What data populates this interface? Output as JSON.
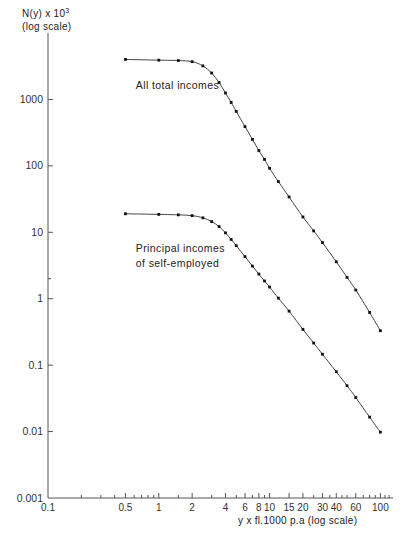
{
  "chart_data": {
    "type": "line",
    "title": "",
    "xlabel": "y x fl.1000 p.a  (log scale)",
    "ylabel_line1": "N(y) x 10",
    "ylabel_exp": "3",
    "ylabel_line2": "(log scale)",
    "xscale": "log",
    "yscale": "log",
    "xlim": [
      0.1,
      130
    ],
    "ylim": [
      0.001,
      10000
    ],
    "grid": false,
    "legend": "inline-annotations",
    "xticks": [
      0.1,
      0.5,
      1,
      2,
      4,
      6,
      8,
      10,
      15,
      20,
      30,
      40,
      60,
      100
    ],
    "xticklabels": [
      "0.1",
      "0.5",
      "1",
      "2",
      "4",
      "6",
      "8",
      "10",
      "15",
      "20",
      "30",
      "40",
      "60",
      "100"
    ],
    "xminorticks": [
      0.2,
      0.3,
      0.4,
      0.6,
      0.7,
      0.8,
      0.9,
      1.5,
      3,
      5,
      7,
      9,
      25,
      35,
      45,
      50,
      70,
      80,
      90,
      110,
      120
    ],
    "yticks": [
      0.001,
      0.01,
      0.1,
      1,
      10,
      100,
      1000
    ],
    "yticklabels": [
      "0.001",
      "0.01",
      "0.1",
      "1",
      "10",
      "100",
      "1000"
    ],
    "yminorticks": [
      2
    ],
    "series": [
      {
        "name": "All total incomes",
        "annotation": "All total incomes",
        "annotation_x": 0.62,
        "annotation_y": 1450,
        "x": [
          0.5,
          1.0,
          1.5,
          2.0,
          2.5,
          3.0,
          3.5,
          4.0,
          4.5,
          5.0,
          6.0,
          7.0,
          8.0,
          9.0,
          10.0,
          12.0,
          15.0,
          20.0,
          25.0,
          30.0,
          40.0,
          50.0,
          60.0,
          80.0,
          100.0
        ],
        "y": [
          4000,
          3900,
          3850,
          3700,
          3200,
          2500,
          1800,
          1250,
          900,
          660,
          390,
          250,
          170,
          125,
          92,
          58,
          34,
          17,
          10.5,
          7.0,
          3.6,
          2.1,
          1.35,
          0.62,
          0.33
        ]
      },
      {
        "name": "Principal incomes of self-employed",
        "annotation_line1": "Principal incomes",
        "annotation_line2": "of self-employed",
        "annotation_x": 0.62,
        "annotation_y": 5.0,
        "x": [
          0.5,
          1.0,
          1.5,
          2.0,
          2.5,
          3.0,
          3.5,
          4.0,
          4.5,
          5.0,
          6.0,
          7.0,
          8.0,
          9.0,
          10.0,
          12.0,
          15.0,
          20.0,
          25.0,
          30.0,
          40.0,
          50.0,
          60.0,
          80.0,
          100.0
        ],
        "y": [
          19.0,
          18.6,
          18.3,
          17.8,
          16.5,
          14.5,
          12.2,
          9.8,
          7.8,
          6.3,
          4.3,
          3.1,
          2.35,
          1.85,
          1.5,
          1.02,
          0.65,
          0.345,
          0.215,
          0.146,
          0.0795,
          0.049,
          0.0325,
          0.0165,
          0.0098
        ]
      }
    ]
  }
}
